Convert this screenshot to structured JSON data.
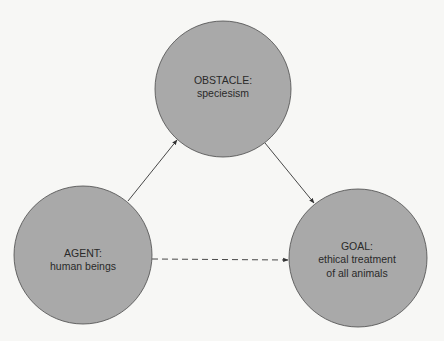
{
  "diagram": {
    "nodes": [
      {
        "id": "obstacle",
        "title": "OBSTACLE:",
        "lines": [
          "speciesism"
        ],
        "cx": 223,
        "cy": 89,
        "r": 68
      },
      {
        "id": "agent",
        "title": "AGENT:",
        "lines": [
          "human beings"
        ],
        "cx": 83,
        "cy": 255,
        "r": 69
      },
      {
        "id": "goal",
        "title": "GOAL:",
        "lines": [
          "ethical treatment",
          "of all animals"
        ],
        "cx": 358,
        "cy": 258,
        "r": 69
      }
    ],
    "edges": [
      {
        "from": "agent",
        "to": "obstacle",
        "style": "solid"
      },
      {
        "from": "obstacle",
        "to": "goal",
        "style": "solid"
      },
      {
        "from": "agent",
        "to": "goal",
        "style": "dashed"
      }
    ],
    "colors": {
      "node_fill": "#a9a9a9",
      "node_stroke": "#4a4a4a",
      "edge": "#333333",
      "text": "#2a2a2a",
      "background": "#f7f7f5"
    }
  }
}
